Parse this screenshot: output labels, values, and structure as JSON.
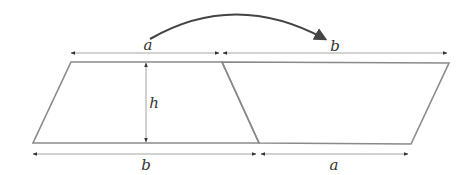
{
  "diagram": {
    "colors": {
      "shape_stroke": "#8a8a8a",
      "dimension_line": "#9a9a9a",
      "arrow_curve": "#444444",
      "label": "#333333"
    },
    "labels": {
      "top_left": "a",
      "top_right": "b",
      "height": "h",
      "bottom_left": "b",
      "bottom_right": "a"
    },
    "shapes": {
      "left_trapezoid": {
        "top": "a",
        "bottom": "b",
        "height": "h"
      },
      "right_trapezoid": {
        "top": "b",
        "bottom": "a"
      }
    },
    "curved_arrow": {
      "from": "a",
      "to": "b"
    }
  }
}
